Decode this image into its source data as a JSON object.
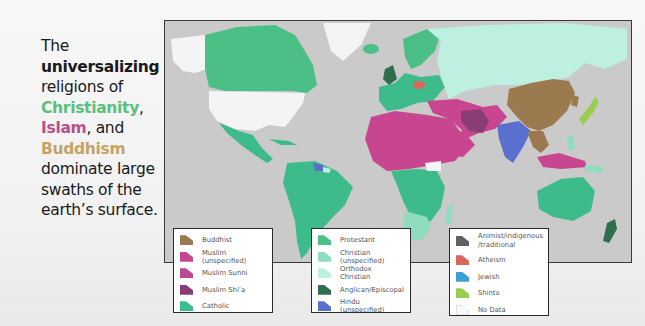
{
  "caption": {
    "lines": [
      {
        "text": "The",
        "style": "normal"
      },
      {
        "text": "universalizing",
        "style": "bold"
      },
      {
        "text": "religions of",
        "style": "normal"
      },
      {
        "text": "Christianity",
        "style": "green",
        "suffix": ","
      },
      {
        "text": "Islam",
        "style": "pink",
        "suffix": ", and"
      },
      {
        "text": "Buddhism",
        "style": "gold"
      },
      {
        "text": "dominate large",
        "style": "normal"
      },
      {
        "text": "swaths of the",
        "style": "normal"
      },
      {
        "text": "earth’s surface.",
        "style": "normal"
      }
    ]
  },
  "map": {
    "title": "World map of dominant religions by country",
    "ocean_color": "#c9cac9"
  },
  "legend": {
    "groups": [
      {
        "items": [
          {
            "label": "Buddhist",
            "color": "#9a7a4e"
          },
          {
            "label": "Muslim (unspecified)",
            "color": "#c8458f"
          },
          {
            "label": "Muslim Sunni",
            "color": "#b84a90"
          },
          {
            "label": "Muslim Shi’a",
            "color": "#8a3c74"
          },
          {
            "label": "Catholic",
            "color": "#3dbb8a"
          }
        ]
      },
      {
        "items": [
          {
            "label": "Protestant",
            "color": "#4cbf86"
          },
          {
            "label": "Christian (unspecified)",
            "color": "#8fdcbf"
          },
          {
            "label": "Orthodox Christian",
            "color": "#bdf0e0"
          },
          {
            "label": "Anglican/Episcopal",
            "color": "#2f6f4e"
          },
          {
            "label": "Hindu (unspecified)",
            "color": "#5b6fcf"
          }
        ]
      },
      {
        "items": [
          {
            "label": "Animist/indigenous\n/traditional",
            "line1": "Animist/indigenous",
            "line2": "/traditional",
            "color": "#616161"
          },
          {
            "label": "Atheism",
            "color": "#d9675e"
          },
          {
            "label": "Jewish",
            "color": "#3e9fd8"
          },
          {
            "label": "Shinto",
            "color": "#9ccc4f"
          },
          {
            "label": "No Data",
            "color": "#fafafa"
          }
        ]
      }
    ]
  },
  "colors": {
    "no_data_land": "#f4f4f4",
    "catholic": "#3dbb8a",
    "protestant": "#4cbf86",
    "orthodox": "#bdf0e0",
    "christian_unspecified": "#8fdcbf",
    "anglican": "#2f6f4e",
    "muslim": "#c8458f",
    "muslim_shia": "#8a3c74",
    "buddhist": "#9a7a4e",
    "hindu": "#5b6fcf",
    "shinto": "#9ccc4f",
    "atheism": "#d9675e"
  }
}
